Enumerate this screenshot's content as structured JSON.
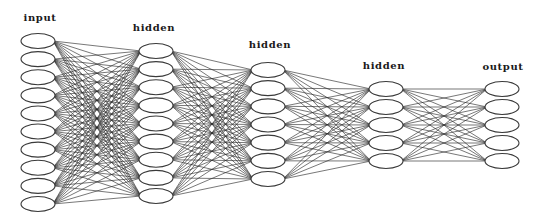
{
  "diagram": {
    "colors": {
      "background": "#ffffff",
      "edge": "#2a2a2a",
      "node_fill": "#ffffff",
      "node_stroke": "#3a3a3a",
      "label": "#1a1a1a"
    },
    "node_rx": 17,
    "node_ry": 7.5,
    "layers": [
      {
        "label": "input",
        "x": 38,
        "label_x": 40,
        "label_y": 13,
        "node_count": 10,
        "y_first": 41,
        "y_last": 204
      },
      {
        "label": "hidden",
        "x": 156,
        "label_x": 154,
        "label_y": 23,
        "node_count": 9,
        "y_first": 51,
        "y_last": 196
      },
      {
        "label": "hidden",
        "x": 268,
        "label_x": 270,
        "label_y": 40,
        "node_count": 7,
        "y_first": 70,
        "y_last": 179
      },
      {
        "label": "hidden",
        "x": 386,
        "label_x": 384,
        "label_y": 61,
        "node_count": 5,
        "y_first": 89,
        "y_last": 161
      },
      {
        "label": "output",
        "x": 502,
        "label_x": 503,
        "label_y": 62,
        "node_count": 5,
        "y_first": 89,
        "y_last": 161
      }
    ],
    "connectivity": "fully-connected between adjacent layers"
  }
}
